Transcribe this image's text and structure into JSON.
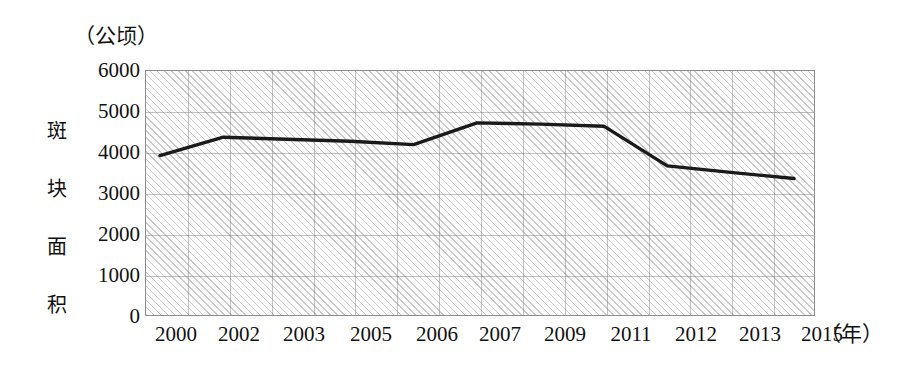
{
  "chart_data": {
    "type": "line",
    "title": "",
    "unit_label": "（公顷）",
    "ylabel": "斑块面积",
    "xlabel": "（年）",
    "categories": [
      "2000",
      "2002",
      "2003",
      "2005",
      "2006",
      "2007",
      "2009",
      "2011",
      "2012",
      "2013",
      "2015"
    ],
    "values": [
      3930,
      4380,
      4330,
      4280,
      4200,
      4730,
      4700,
      4650,
      3680,
      3520,
      3370
    ],
    "series": [
      {
        "name": "斑块面积",
        "values": [
          3930,
          4380,
          4330,
          4280,
          4200,
          4730,
          4700,
          4650,
          3680,
          3520,
          3370
        ]
      }
    ],
    "ylim": [
      0,
      6000
    ],
    "y_ticks": [
      "6000",
      "5000",
      "4000",
      "3000",
      "2000",
      "1000",
      "0"
    ],
    "y_tick_values": [
      6000,
      5000,
      4000,
      3000,
      2000,
      1000,
      0
    ],
    "grid": true,
    "legend": "none",
    "line_color": "#1a1a1a",
    "plot_background": "#f4f4f4",
    "hatch": "diagonal-45"
  }
}
